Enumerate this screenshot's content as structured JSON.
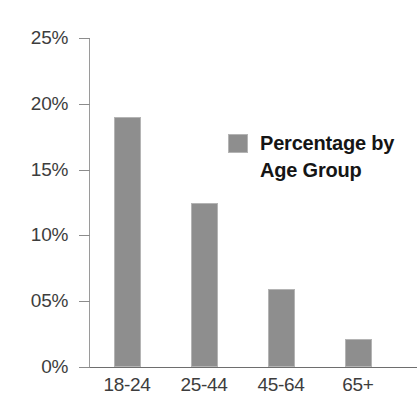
{
  "clipped_title": "",
  "legend": {
    "label": "Percentage by Age Group",
    "swatch_color": "#8e8e8e",
    "position": "inside-top-right"
  },
  "axis": {
    "y_ticks": [
      "25%",
      "20%",
      "15%",
      "10%",
      "05%",
      "0%"
    ],
    "x_ticks": [
      "18-24",
      "25-44",
      "45-64",
      "65+"
    ]
  },
  "colors": {
    "bar_fill": "#8e8e8e",
    "bar_edge": "#b4b4b4",
    "axis_line": "#6e6e6e",
    "tick_text": "#3d3d3d",
    "legend_text": "#151515",
    "background": "#ffffff"
  },
  "chart_data": {
    "type": "bar",
    "title": "",
    "subtitle": "",
    "xlabel": "",
    "ylabel": "",
    "categories": [
      "18-24",
      "25-44",
      "45-64",
      "65+"
    ],
    "values": [
      19.0,
      12.5,
      5.9,
      2.1
    ],
    "series": [
      {
        "name": "Percentage by Age Group",
        "values": [
          19.0,
          12.5,
          5.9,
          2.1
        ],
        "color": "#8e8e8e"
      }
    ],
    "ylim": [
      0,
      25
    ],
    "ytick_values": [
      0,
      5,
      10,
      15,
      20,
      25
    ],
    "ytick_labels": [
      "0%",
      "05%",
      "10%",
      "15%",
      "20%",
      "25%"
    ],
    "grid": false,
    "legend_position": "upper right",
    "value_unit": "percent",
    "annotations": []
  }
}
